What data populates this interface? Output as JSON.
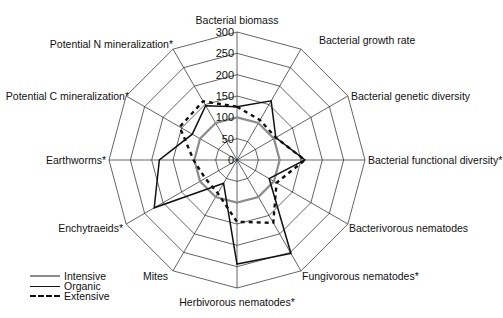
{
  "chart_data": {
    "type": "radar",
    "title": "",
    "center": [
      237,
      160
    ],
    "radius_px": 128,
    "rmax": 300,
    "ticks": [
      0,
      50,
      100,
      150,
      200,
      250,
      300
    ],
    "axes": [
      "Bacterial biomass",
      "Bacterial growth rate",
      "Bacterial genetic diversity",
      "Bacterial functional diversity*",
      "Bacterivorous nematodes",
      "Fungivorous nematodes*",
      "Herbivorous nematodes*",
      "Mites",
      "Enchytraeids*",
      "Earthworms*",
      "Potential C mineralization*",
      "Potential N mineralization*"
    ],
    "series": [
      {
        "name": "Intensive",
        "style": "solid-gray",
        "color": "#8c8c8c",
        "values": [
          100,
          100,
          100,
          100,
          100,
          100,
          100,
          100,
          100,
          100,
          100,
          100
        ]
      },
      {
        "name": "Organic",
        "style": "solid",
        "color": "#111111",
        "values": [
          125,
          160,
          105,
          159,
          87,
          253,
          244,
          63,
          224,
          182,
          121,
          147
        ]
      },
      {
        "name": "Extensive",
        "style": "dashed",
        "color": "#111111",
        "values": [
          125,
          108,
          105,
          159,
          107,
          170,
          145,
          90,
          86,
          102,
          155,
          159
        ]
      }
    ],
    "legend_position": "bottom-left",
    "grid": "polygon"
  },
  "legend": {
    "items": [
      "Intensive",
      "Organic",
      "Extensive"
    ]
  }
}
